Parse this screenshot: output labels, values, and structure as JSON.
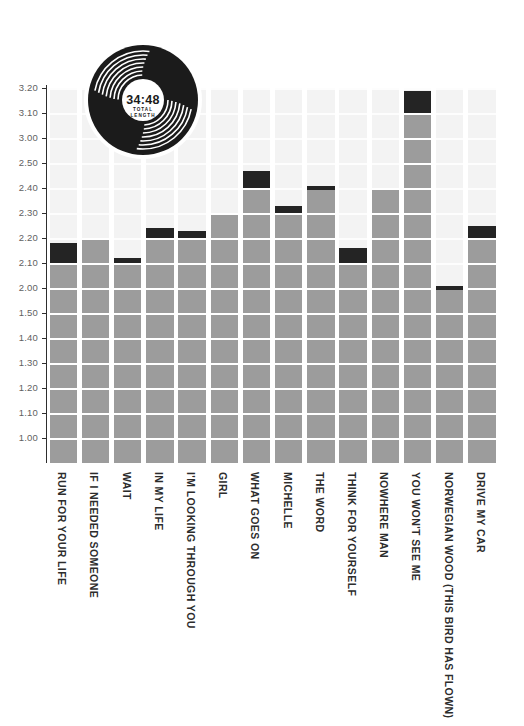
{
  "page": {
    "background": "#ffffff"
  },
  "vinyl_badge": {
    "total_time": "34:48",
    "caption_line1": "TOTAL",
    "caption_line2": "LENGTH"
  },
  "chart_data": {
    "type": "bar",
    "title": "",
    "subtitle": "",
    "unit": "track length, minutes:seconds — one gridline = 10 seconds",
    "legend": [],
    "grid": true,
    "y_axis": {
      "tick_labels": [
        "3.20",
        "3.10",
        "3.00",
        "2.50",
        "2.40",
        "2.30",
        "2.20",
        "2.10",
        "2.00",
        "1.50",
        "1.40",
        "1.30",
        "1.20",
        "1.10",
        "1.00"
      ],
      "top_value_seconds": 200,
      "bottom_value_seconds": 60
    },
    "categories": [
      "RUN FOR YOUR LIFE",
      "IF I NEEDED SOMEONE",
      "WAIT",
      "IN MY LIFE",
      "I'M LOOKING THROUGH YOU",
      "GIRL",
      "WHAT GOES ON",
      "MICHELLE",
      "THE WORD",
      "THINK FOR YOURSELF",
      "NOWHERE MAN",
      "YOU WON'T SEE ME",
      "NORWEGIAN WOOD (THIS BIRD HAS FLOWN)",
      "DRIVE MY CAR"
    ],
    "lengths": [
      "2:18",
      "2:20",
      "2:12",
      "2:24",
      "2:23",
      "2:30",
      "2:47",
      "2:33",
      "2:41",
      "2:16",
      "2:40",
      "3:19",
      "2:01",
      "2:25"
    ],
    "values_seconds": [
      138,
      140,
      132,
      144,
      143,
      150,
      167,
      153,
      161,
      136,
      160,
      199,
      121,
      145
    ],
    "total_length": "34:48",
    "colors": {
      "bar": "#9c9c9c",
      "cap": "#242424",
      "background_column": "#f3f3f3",
      "axis": "#2e2e2e",
      "tick_label": "#5f5f5f",
      "category_label": "#2c2c2c",
      "vinyl": "#1b1b1b"
    }
  }
}
